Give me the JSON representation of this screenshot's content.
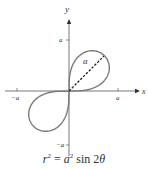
{
  "figure": {
    "axis_labels": {
      "x": "x",
      "y": "y"
    },
    "ticks": {
      "x_pos": "a",
      "x_neg": "−a",
      "y_pos": "a",
      "y_neg": "−a"
    },
    "radius_label": "a",
    "curve": {
      "equation_lhs_var": "r",
      "equation_rhs_coef": "a",
      "equation_fn": "sin 2",
      "equation_angle": "θ",
      "exp": "2",
      "equals": "=",
      "color": "#7a7a7a",
      "scale_px": 50
    },
    "colors": {
      "axis": "#555555",
      "curve": "#7a7a7a",
      "dashed": "#222222",
      "text": "#333333"
    }
  }
}
